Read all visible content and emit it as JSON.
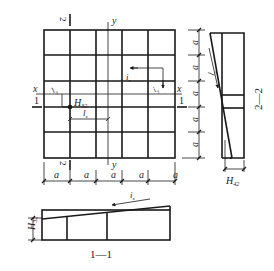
{
  "diagram": {
    "type": "engineering-drawing",
    "plan": {
      "grid": {
        "columns": 5,
        "rows": 5,
        "cell_label": "a"
      },
      "axis_x_label": "x",
      "axis_y_label": "y",
      "axis_y_label_bottom": "y",
      "section_1_mark": "1",
      "section_2_mark_top": "2",
      "section_2_mark_bottom": "2",
      "height_label": "H",
      "height_label_sub": "32",
      "slope_x_label": "i",
      "slope_x_sub": "x",
      "slope_y_label": "i",
      "slope_y_sub": "y",
      "length_x_label": "l",
      "length_x_sub": "x",
      "length_y_label": "l",
      "length_y_sub": "y",
      "bottom_dims": [
        "a",
        "a",
        "a",
        "a",
        "a"
      ]
    },
    "section_2_2": {
      "title": "2—2",
      "right_dims": [
        "a",
        "a",
        "a",
        "a",
        "a"
      ],
      "length_label": "l",
      "length_sub": "y",
      "height_label": "H",
      "height_sub": "42"
    },
    "section_1_1": {
      "title": "1—1",
      "slope_label": "i",
      "slope_sub": "x",
      "height_label": "H",
      "height_sub": "32"
    },
    "colors": {
      "line": "#1a1a1a",
      "background": "#ffffff"
    }
  }
}
